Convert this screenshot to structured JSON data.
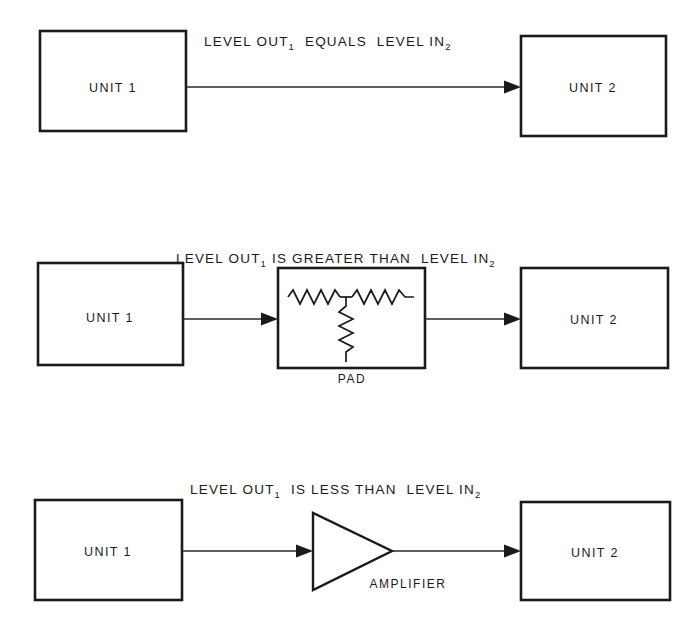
{
  "figure": {
    "background_color": "#ffffff",
    "line_color": "#1a1a1a",
    "width": 700,
    "height": 631
  },
  "rows": [
    {
      "id": "row-equal",
      "source_box_label": "UNIT 1",
      "destination_box_label": "UNIT 2",
      "relation": {
        "prefix": "LEVEL OUT",
        "prefix_subscript": "1",
        "comparison": "EQUALS",
        "suffix": "LEVEL IN",
        "suffix_subscript": "2"
      },
      "inline_component": null,
      "inline_component_label": null
    },
    {
      "id": "row-greater",
      "source_box_label": "UNIT 1",
      "destination_box_label": "UNIT 2",
      "relation": {
        "prefix": "LEVEL OUT",
        "prefix_subscript": "1",
        "comparison": "IS GREATER THAN",
        "suffix": "LEVEL IN",
        "suffix_subscript": "2"
      },
      "inline_component": "pad",
      "inline_component_label": "PAD"
    },
    {
      "id": "row-less",
      "source_box_label": "UNIT 1",
      "destination_box_label": "UNIT 2",
      "relation": {
        "prefix": "LEVEL OUT",
        "prefix_subscript": "1",
        "comparison": "IS LESS THAN",
        "suffix": "LEVEL IN",
        "suffix_subscript": "2"
      },
      "inline_component": "amplifier",
      "inline_component_label": "AMPLIFIER"
    }
  ]
}
